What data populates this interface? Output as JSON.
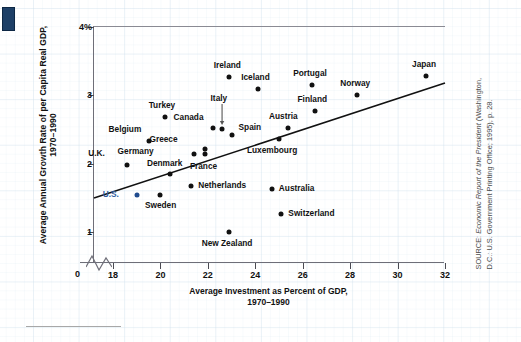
{
  "figure": {
    "source_label": "SOURCE: ",
    "source_title": "Economic Report of the President",
    "source_rest": " (Washington, D.C.: U.S. Government Printing Office; 1995), p. 28."
  },
  "chart_data": {
    "type": "scatter",
    "title": "",
    "xlabel": "Average Investment as Percent of GDP,\n1970–1990",
    "ylabel": "Average Annual Growth Rate of per Capita Real GDP,\n1970–1990",
    "xlim": [
      17.2,
      32.0
    ],
    "ylim": [
      0.55,
      4.0
    ],
    "xticks": [
      18,
      20,
      22,
      24,
      26,
      28,
      30,
      32
    ],
    "xtick_labels": [
      "18",
      "20",
      "22",
      "24",
      "26",
      "28",
      "30",
      "32"
    ],
    "yticks": [
      1,
      2,
      3,
      4
    ],
    "ytick_labels": [
      "1",
      "2",
      "3",
      "4%"
    ],
    "origin_label": "0",
    "axis_break": true,
    "grid": "graph-paper",
    "legend": "none",
    "trendline": {
      "label": "regression line",
      "x1": 17.2,
      "y1": 1.5,
      "x2": 32.0,
      "y2": 3.18
    },
    "highlight_color": "#2c5aa0",
    "point_color": "#111111",
    "points": [
      {
        "label": "U.K.",
        "x": 18.6,
        "y": 1.98,
        "dx": -30,
        "dy": -11,
        "highlight": false
      },
      {
        "label": "U.S.",
        "x": 19.0,
        "y": 1.55,
        "dx": -26,
        "dy": 0,
        "highlight": true
      },
      {
        "label": "Belgium",
        "x": 19.5,
        "y": 2.34,
        "dx": -15,
        "dy": -11,
        "highlight": false
      },
      {
        "label": "Sweden",
        "x": 20.0,
        "y": 1.55,
        "dx": 0,
        "dy": 11,
        "highlight": false
      },
      {
        "label": "Turkey",
        "x": 20.2,
        "y": 2.68,
        "dx": -3,
        "dy": -11,
        "highlight": false
      },
      {
        "label": "Denmark",
        "x": 20.4,
        "y": 1.85,
        "dx": -5,
        "dy": -10,
        "highlight": false
      },
      {
        "label": "Netherlands",
        "x": 21.3,
        "y": 1.67,
        "dx": 7,
        "dy": 0,
        "highlight": false
      },
      {
        "label": "Germany",
        "x": 21.4,
        "y": 2.15,
        "dx": -48,
        "dy": -2,
        "highlight": false
      },
      {
        "label": "France",
        "x": 21.9,
        "y": 2.14,
        "dx": -2,
        "dy": 13,
        "highlight": false
      },
      {
        "label": "Greece",
        "x": 21.9,
        "y": 2.22,
        "dx": -36,
        "dy": -9,
        "highlight": false
      },
      {
        "label": "Canada",
        "x": 22.2,
        "y": 2.52,
        "dx": -17,
        "dy": -10,
        "highlight": false
      },
      {
        "label": "Italy",
        "x": 22.6,
        "y": 2.51,
        "dx": -3,
        "dy": -30,
        "highlight": false,
        "leader": true
      },
      {
        "label": "New Zealand",
        "x": 22.9,
        "y": 1.01,
        "dx": -2,
        "dy": 12,
        "highlight": false
      },
      {
        "label": "Ireland",
        "x": 22.9,
        "y": 3.27,
        "dx": -2,
        "dy": -11,
        "highlight": false
      },
      {
        "label": "Spain",
        "x": 23.0,
        "y": 2.42,
        "dx": 7,
        "dy": -7,
        "highlight": false
      },
      {
        "label": "Iceland",
        "x": 24.1,
        "y": 3.1,
        "dx": -2,
        "dy": -11,
        "highlight": false
      },
      {
        "label": "Australia",
        "x": 24.7,
        "y": 1.63,
        "dx": 7,
        "dy": 0,
        "highlight": false
      },
      {
        "label": "Luxembourg",
        "x": 25.0,
        "y": 2.37,
        "dx": -7,
        "dy": 12,
        "highlight": false
      },
      {
        "label": "Switzerland",
        "x": 25.1,
        "y": 1.26,
        "dx": 7,
        "dy": 0,
        "highlight": false
      },
      {
        "label": "Austria",
        "x": 25.4,
        "y": 2.52,
        "dx": -5,
        "dy": -11,
        "highlight": false
      },
      {
        "label": "Portugal",
        "x": 26.4,
        "y": 3.15,
        "dx": -2,
        "dy": -11,
        "highlight": false
      },
      {
        "label": "Finland",
        "x": 26.5,
        "y": 2.77,
        "dx": -2,
        "dy": -11,
        "highlight": false
      },
      {
        "label": "Norway",
        "x": 28.3,
        "y": 3.0,
        "dx": -2,
        "dy": -11,
        "highlight": false
      },
      {
        "label": "Japan",
        "x": 31.2,
        "y": 3.28,
        "dx": -2,
        "dy": -11,
        "highlight": false
      }
    ]
  }
}
